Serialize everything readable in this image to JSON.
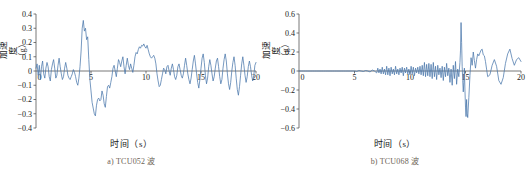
{
  "figure": {
    "panels": [
      {
        "id": "tcu052",
        "caption": "a) TCU052 波",
        "xlabel": "时间（s）",
        "ylabel": "加速度（g）",
        "ylabel_chars": [
          "加",
          "速",
          "度",
          "（",
          "g",
          "）"
        ]
      },
      {
        "id": "tcu068",
        "caption": "b) TCU068 波",
        "xlabel": "时间（s）",
        "ylabel": "加速度（g）",
        "ylabel_chars": [
          "加",
          "速",
          "度",
          "（",
          "g",
          "）"
        ]
      }
    ]
  },
  "colors": {
    "trace": "#4a77ab",
    "axis": "#555555",
    "text": "#1a1a1a",
    "caption": "#6d6255",
    "background": "#ffffff"
  },
  "chart_data": [
    {
      "type": "line",
      "id": "tcu052",
      "title": "a) TCU052 波",
      "xlabel": "时间（s）",
      "ylabel": "加速度（g）",
      "xlim": [
        0,
        20
      ],
      "ylim": [
        -0.4,
        0.4
      ],
      "xticks": [
        0,
        5,
        10,
        15,
        20
      ],
      "xticklabels": [
        "0",
        "5",
        "10",
        "15",
        "20"
      ],
      "yticks": [
        -0.4,
        -0.3,
        -0.2,
        -0.1,
        0,
        0.1,
        0.2,
        0.3,
        0.4
      ],
      "yticklabels": [
        "−0.4",
        "−0.3",
        "−0.2",
        "−0.1",
        "0",
        "0.1",
        "0.2",
        "0.3",
        "0.4"
      ],
      "grid": false,
      "legend": null,
      "series": [
        {
          "name": "TCU052 acceleration",
          "color": "#4a77ab",
          "x": [
            0.0,
            0.1,
            0.2,
            0.3,
            0.4,
            0.5,
            0.6,
            0.7,
            0.8,
            0.9,
            1.0,
            1.1,
            1.2,
            1.3,
            1.4,
            1.5,
            1.6,
            1.7,
            1.8,
            1.9,
            2.0,
            2.1,
            2.2,
            2.3,
            2.4,
            2.5,
            2.6,
            2.7,
            2.8,
            2.9,
            3.0,
            3.1,
            3.2,
            3.3,
            3.4,
            3.5,
            3.6,
            3.7,
            3.8,
            3.9,
            4.0,
            4.1,
            4.2,
            4.3,
            4.4,
            4.5,
            4.6,
            4.7,
            4.8,
            4.9,
            5.0,
            5.1,
            5.2,
            5.3,
            5.4,
            5.5,
            5.6,
            5.7,
            5.8,
            5.9,
            6.0,
            6.1,
            6.2,
            6.3,
            6.4,
            6.5,
            6.6,
            6.7,
            6.8,
            6.9,
            7.0,
            7.1,
            7.2,
            7.3,
            7.4,
            7.5,
            7.6,
            7.7,
            7.8,
            7.9,
            8.0,
            8.1,
            8.2,
            8.3,
            8.4,
            8.5,
            8.6,
            8.7,
            8.8,
            8.9,
            9.0,
            9.1,
            9.2,
            9.3,
            9.4,
            9.5,
            9.6,
            9.7,
            9.8,
            9.9,
            10.0,
            10.1,
            10.2,
            10.3,
            10.4,
            10.5,
            10.6,
            10.7,
            10.8,
            10.9,
            11.0,
            11.1,
            11.2,
            11.3,
            11.4,
            11.5,
            11.6,
            11.7,
            11.8,
            11.9,
            12.0,
            12.1,
            12.2,
            12.3,
            12.4,
            12.5,
            12.6,
            12.7,
            12.8,
            12.9,
            13.0,
            13.1,
            13.2,
            13.3,
            13.4,
            13.5,
            13.6,
            13.7,
            13.8,
            13.9,
            14.0,
            14.1,
            14.2,
            14.3,
            14.4,
            14.5,
            14.6,
            14.7,
            14.8,
            14.9,
            15.0,
            15.1,
            15.2,
            15.3,
            15.4,
            15.5,
            15.6,
            15.7,
            15.8,
            15.9,
            16.0,
            16.1,
            16.2,
            16.3,
            16.4,
            16.5,
            16.6,
            16.7,
            16.8,
            16.9,
            17.0,
            17.1,
            17.2,
            17.3,
            17.4,
            17.5,
            17.6,
            17.7,
            17.8,
            17.9,
            18.0,
            18.1,
            18.2,
            18.3,
            18.4,
            18.5,
            18.6,
            18.7,
            18.8,
            18.9,
            19.0,
            19.1,
            19.2,
            19.3,
            19.4,
            19.5,
            19.6,
            19.7,
            19.8,
            19.9,
            20.0
          ],
          "y": [
            0.02,
            0.05,
            -0.03,
            0.04,
            -0.06,
            0.03,
            0.07,
            -0.02,
            -0.05,
            0.02,
            0.06,
            0.03,
            -0.04,
            -0.07,
            0.01,
            0.05,
            0.08,
            0.02,
            -0.05,
            -0.03,
            0.04,
            0.09,
            0.03,
            -0.02,
            -0.06,
            -0.04,
            0.02,
            0.06,
            0.02,
            -0.03,
            -0.05,
            -0.06,
            -0.04,
            -0.02,
            0.01,
            -0.01,
            -0.04,
            -0.08,
            -0.1,
            -0.05,
            0.03,
            0.14,
            0.3,
            0.355,
            0.28,
            0.3,
            0.22,
            0.24,
            0.08,
            -0.06,
            -0.14,
            -0.22,
            -0.26,
            -0.3,
            -0.315,
            -0.24,
            -0.2,
            -0.19,
            -0.21,
            -0.2,
            -0.14,
            -0.17,
            -0.23,
            -0.255,
            -0.18,
            -0.11,
            -0.1,
            -0.12,
            -0.08,
            -0.04,
            0.02,
            0.04,
            0.0,
            -0.04,
            0.02,
            0.08,
            0.06,
            0.03,
            0.07,
            0.1,
            0.03,
            -0.02,
            0.04,
            0.09,
            0.04,
            0.01,
            0.05,
            0.02,
            -0.01,
            0.04,
            0.1,
            0.13,
            0.12,
            0.15,
            0.17,
            0.16,
            0.18,
            0.175,
            0.19,
            0.17,
            0.16,
            0.18,
            0.15,
            0.12,
            0.1,
            0.09,
            0.1,
            0.11,
            0.09,
            0.05,
            -0.02,
            -0.07,
            -0.11,
            -0.1,
            -0.06,
            -0.02,
            0.02,
            0.01,
            -0.02,
            0.03,
            0.04,
            0.0,
            -0.03,
            0.02,
            0.05,
            0.01,
            -0.04,
            -0.06,
            -0.03,
            0.03,
            0.05,
            0.01,
            -0.03,
            -0.05,
            -0.02,
            0.04,
            0.09,
            0.04,
            -0.02,
            -0.06,
            -0.09,
            -0.05,
            0.01,
            0.07,
            0.11,
            0.05,
            -0.02,
            -0.08,
            -0.12,
            -0.06,
            0.02,
            0.09,
            0.12,
            0.06,
            -0.03,
            -0.09,
            -0.05,
            0.03,
            0.08,
            0.04,
            -0.02,
            -0.07,
            -0.04,
            0.02,
            0.07,
            0.09,
            0.03,
            -0.04,
            -0.09,
            -0.06,
            0.02,
            0.08,
            0.12,
            0.07,
            -0.02,
            -0.09,
            -0.13,
            -0.08,
            0.0,
            0.06,
            0.1,
            0.04,
            -0.05,
            -0.13,
            -0.17,
            -0.11,
            -0.03,
            0.05,
            0.1,
            0.04,
            -0.03,
            -0.08,
            -0.04,
            0.03,
            0.07,
            0.03,
            -0.03,
            -0.07,
            -0.03,
            0.04,
            0.06,
            0.02,
            -0.03,
            -0.05,
            0.0,
            0.05
          ]
        }
      ]
    },
    {
      "type": "line",
      "id": "tcu068",
      "title": "b) TCU068 波",
      "xlabel": "时间（s）",
      "ylabel": "加速度（g）",
      "xlim": [
        0,
        20
      ],
      "ylim": [
        -0.6,
        0.6
      ],
      "xticks": [
        0,
        5,
        10,
        15,
        20
      ],
      "xticklabels": [
        "0",
        "5",
        "10",
        "15",
        "20"
      ],
      "yticks": [
        -0.6,
        -0.4,
        -0.2,
        0,
        0.2,
        0.4,
        0.6
      ],
      "yticklabels": [
        "−0.6",
        "−0.4",
        "−0.2",
        "0",
        "0.2",
        "0.4",
        "0.6"
      ],
      "grid": false,
      "legend": null,
      "series": [
        {
          "name": "TCU068 acceleration",
          "color": "#4a77ab",
          "x": [
            0.0,
            0.2,
            0.4,
            0.6,
            0.8,
            1.0,
            1.2,
            1.4,
            1.6,
            1.8,
            2.0,
            2.2,
            2.4,
            2.6,
            2.8,
            3.0,
            3.2,
            3.4,
            3.6,
            3.8,
            4.0,
            4.2,
            4.4,
            4.6,
            4.8,
            5.0,
            5.2,
            5.4,
            5.6,
            5.8,
            6.0,
            6.2,
            6.4,
            6.6,
            6.8,
            7.0,
            7.1,
            7.2,
            7.3,
            7.4,
            7.5,
            7.6,
            7.7,
            7.8,
            7.9,
            8.0,
            8.1,
            8.2,
            8.3,
            8.4,
            8.5,
            8.6,
            8.7,
            8.8,
            8.9,
            9.0,
            9.1,
            9.2,
            9.3,
            9.4,
            9.5,
            9.6,
            9.7,
            9.8,
            9.9,
            10.0,
            10.1,
            10.2,
            10.3,
            10.4,
            10.5,
            10.6,
            10.7,
            10.8,
            10.9,
            11.0,
            11.1,
            11.2,
            11.3,
            11.4,
            11.5,
            11.6,
            11.7,
            11.8,
            11.9,
            12.0,
            12.1,
            12.2,
            12.3,
            12.4,
            12.5,
            12.6,
            12.7,
            12.8,
            12.9,
            13.0,
            13.1,
            13.2,
            13.3,
            13.4,
            13.5,
            13.6,
            13.7,
            13.8,
            13.9,
            14.0,
            14.1,
            14.2,
            14.3,
            14.4,
            14.5,
            14.55,
            14.6,
            14.65,
            14.7,
            14.75,
            14.8,
            14.85,
            14.9,
            14.95,
            15.0,
            15.05,
            15.1,
            15.15,
            15.2,
            15.3,
            15.4,
            15.5,
            15.6,
            15.7,
            15.8,
            15.9,
            16.0,
            16.1,
            16.2,
            16.3,
            16.4,
            16.5,
            16.6,
            16.7,
            16.8,
            16.9,
            17.0,
            17.2,
            17.4,
            17.6,
            17.8,
            18.0,
            18.2,
            18.4,
            18.6,
            18.8,
            19.0,
            19.2,
            19.4,
            19.6,
            19.8,
            20.0
          ],
          "y": [
            0.0,
            0.0,
            0.0,
            0.0,
            0.0,
            0.0,
            0.0,
            0.0,
            0.0,
            0.0,
            0.0,
            0.0,
            0.0,
            0.0,
            0.0,
            0.0,
            0.0,
            0.0,
            0.0,
            0.0,
            0.0,
            0.0,
            0.0,
            0.0,
            0.0,
            0.0,
            -0.005,
            0.005,
            0.0,
            -0.005,
            0.005,
            0.0,
            -0.01,
            0.01,
            0.0,
            -0.02,
            0.03,
            -0.02,
            0.02,
            -0.03,
            0.04,
            -0.03,
            0.02,
            -0.04,
            0.05,
            -0.04,
            0.03,
            -0.05,
            0.04,
            -0.03,
            0.02,
            -0.04,
            0.05,
            -0.03,
            0.02,
            -0.04,
            0.03,
            -0.02,
            0.04,
            -0.05,
            0.03,
            -0.02,
            0.04,
            -0.03,
            0.02,
            -0.04,
            0.05,
            -0.03,
            0.04,
            -0.05,
            0.03,
            -0.02,
            0.04,
            -0.03,
            0.05,
            -0.04,
            0.06,
            -0.05,
            0.09,
            -0.06,
            0.07,
            -0.05,
            0.08,
            -0.06,
            0.07,
            -0.08,
            0.09,
            -0.06,
            0.05,
            -0.09,
            0.06,
            -0.04,
            0.03,
            -0.07,
            0.05,
            -0.1,
            0.04,
            -0.06,
            0.08,
            -0.05,
            0.03,
            -0.12,
            0.02,
            -0.15,
            0.06,
            -0.08,
            0.1,
            -0.14,
            0.02,
            -0.06,
            0.09,
            0.22,
            0.51,
            0.3,
            0.05,
            -0.1,
            -0.22,
            -0.12,
            0.03,
            -0.2,
            -0.38,
            -0.48,
            -0.3,
            -0.45,
            -0.49,
            -0.28,
            -0.05,
            0.14,
            0.06,
            0.2,
            0.11,
            0.03,
            0.12,
            0.18,
            0.16,
            0.19,
            0.22,
            0.23,
            0.17,
            0.16,
            0.1,
            0.02,
            -0.06,
            -0.04,
            0.06,
            0.12,
            0.05,
            -0.1,
            -0.14,
            -0.07,
            0.08,
            0.18,
            0.23,
            0.13,
            0.06,
            0.12,
            0.14,
            0.1,
            0.13,
            0.05,
            -0.02
          ]
        }
      ]
    }
  ]
}
